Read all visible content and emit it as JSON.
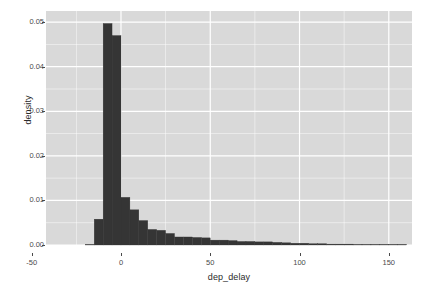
{
  "chart_data": {
    "type": "bar",
    "title": "",
    "subtitle": "",
    "xlabel": "dep_delay",
    "ylabel": "density",
    "xlim": [
      -42,
      163
    ],
    "ylim": [
      0.0,
      0.0525
    ],
    "grid": true,
    "legend": null,
    "binwidth": 5,
    "bar_color": "#353535",
    "panel_color": "#d9d9d9",
    "gridline_color": "#ffffff",
    "x_ticks": [
      "-50",
      "0",
      "50",
      "100",
      "150"
    ],
    "x_tick_values": [
      -50,
      0,
      50,
      100,
      150
    ],
    "y_ticks": [
      "0.00",
      "0.01",
      "0.02",
      "0.03",
      "0.04",
      "0.05"
    ],
    "y_tick_values": [
      0.0,
      0.01,
      0.02,
      0.03,
      0.04,
      0.05
    ],
    "bin_left_edges": [
      -20,
      -15,
      -10,
      -5,
      0,
      5,
      10,
      15,
      20,
      25,
      30,
      35,
      40,
      45,
      50,
      55,
      60,
      65,
      70,
      75,
      80,
      85,
      90,
      95,
      100,
      105,
      110,
      115,
      120,
      125,
      130,
      135,
      140,
      145,
      150,
      155
    ],
    "values": [
      0.0,
      0.0058,
      0.0497,
      0.047,
      0.0107,
      0.0079,
      0.0055,
      0.0035,
      0.0033,
      0.0026,
      0.0018,
      0.0018,
      0.0017,
      0.0016,
      0.0011,
      0.0011,
      0.001,
      0.0008,
      0.0008,
      0.0007,
      0.0007,
      0.0006,
      0.0005,
      0.0004,
      0.0004,
      0.0003,
      0.0003,
      0.0002,
      0.0002,
      0.0002,
      0.0001,
      0.0001,
      0.0001,
      0.0001,
      0.0001,
      0.0
    ]
  }
}
